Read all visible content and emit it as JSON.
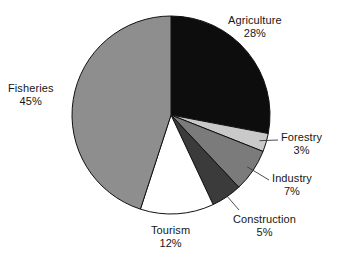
{
  "chart_data": {
    "type": "pie",
    "title": "",
    "subtitle": "",
    "xlabel": "",
    "ylabel": "",
    "legend_position": "none",
    "grid": false,
    "start_angle_deg": 0,
    "direction": "clockwise",
    "units": "percent",
    "total": 100,
    "categories": [
      "Agriculture",
      "Forestry",
      "Industry",
      "Construction",
      "Tourism",
      "Fisheries"
    ],
    "values": [
      28,
      3,
      7,
      5,
      12,
      45
    ],
    "slices": [
      {
        "name": "Agriculture",
        "value": 28,
        "value_text": "28%",
        "color": "#0d0d0d",
        "label_position": "outside-right-top",
        "leader_line": false
      },
      {
        "name": "Forestry",
        "value": 3,
        "value_text": "3%",
        "color": "#c9c9c9",
        "label_position": "outside-right",
        "leader_line": true
      },
      {
        "name": "Industry",
        "value": 7,
        "value_text": "7%",
        "color": "#7b7b7b",
        "label_position": "outside-right",
        "leader_line": true
      },
      {
        "name": "Construction",
        "value": 5,
        "value_text": "5%",
        "color": "#3b3b3b",
        "label_position": "outside-right-bottom",
        "leader_line": true
      },
      {
        "name": "Tourism",
        "value": 12,
        "value_text": "12%",
        "color": "#ffffff",
        "label_position": "outside-bottom",
        "leader_line": false
      },
      {
        "name": "Fisheries",
        "value": 45,
        "value_text": "45%",
        "color": "#8e8e8e",
        "label_position": "outside-left",
        "leader_line": false
      }
    ],
    "style": {
      "background": "#ffffff",
      "outline_color": "#111111",
      "outline_width": 1,
      "leader_line_color": "#3a3a3a",
      "text_color": "#161616"
    },
    "geometry": {
      "center_x": 171,
      "center_y": 115,
      "radius": 99
    }
  }
}
